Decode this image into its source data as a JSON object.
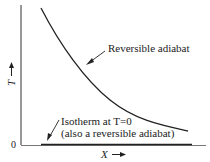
{
  "diagram": {
    "type": "T-X plot of reversible adiabat and T=0 isotherm",
    "axes": {
      "y_label": "T",
      "y_arrow": "→",
      "x_label": "X",
      "x_arrow": "→",
      "origin_label": "0"
    },
    "annotations": {
      "adiabat_label": "Reversible adiabat",
      "isotherm_label_line1": "Isotherm at T=0",
      "isotherm_label_line2": "(also a reversible adiabat)"
    },
    "colors": {
      "line": "#222222",
      "background": "#ffffff"
    }
  }
}
